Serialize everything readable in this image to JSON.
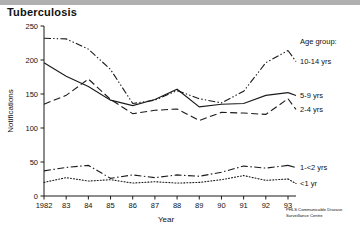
{
  "figure": {
    "title": "Tuberculosis",
    "source_line1": "PHLS Communicable Disease",
    "source_line2": "Surveillance Centre"
  },
  "legend": {
    "header": "Age group:",
    "items": [
      {
        "label": "10-14 yrs",
        "dash": "dashdotdot"
      },
      {
        "label": "5-9 yrs",
        "dash": "solid"
      },
      {
        "label": "2-4 yrs",
        "dash": "dashed"
      },
      {
        "label": "1-<2 yrs",
        "dash": "dashdot"
      },
      {
        "label": "<1 yr",
        "dash": "dotted"
      }
    ]
  },
  "chart_data": {
    "type": "line",
    "title": "Tuberculosis",
    "xlabel": "Year",
    "ylabel": "Notifications",
    "x": [
      1982,
      1983,
      1984,
      1985,
      1986,
      1987,
      1988,
      1989,
      1990,
      1991,
      1992,
      1993
    ],
    "xticklabels": [
      "1982",
      "83",
      "84",
      "85",
      "86",
      "87",
      "88",
      "89",
      "90",
      "91",
      "92",
      "93"
    ],
    "yticks": [
      0,
      50,
      100,
      150,
      200,
      250
    ],
    "ylim": [
      0,
      250
    ],
    "xlim": [
      1982,
      1993
    ],
    "grid": false,
    "legend_position": "right",
    "series": [
      {
        "name": "10-14 yrs",
        "dash": "dashdotdot",
        "values": [
          232,
          231,
          216,
          186,
          136,
          141,
          155,
          143,
          137,
          154,
          196,
          214
        ]
      },
      {
        "name": "5-9 yrs",
        "dash": "solid",
        "values": [
          196,
          176,
          161,
          141,
          133,
          142,
          157,
          131,
          135,
          136,
          148,
          152
        ]
      },
      {
        "name": "2-4 yrs",
        "dash": "dashed",
        "values": [
          135,
          148,
          172,
          142,
          121,
          126,
          128,
          111,
          123,
          122,
          120,
          143
        ]
      },
      {
        "name": "1-<2 yrs",
        "dash": "dashdot",
        "values": [
          37,
          42,
          45,
          26,
          31,
          27,
          31,
          29,
          35,
          44,
          41,
          45
        ]
      },
      {
        "name": "<1 yr",
        "dash": "dotted",
        "values": [
          20,
          27,
          22,
          24,
          19,
          21,
          19,
          20,
          24,
          30,
          23,
          25
        ]
      }
    ]
  }
}
